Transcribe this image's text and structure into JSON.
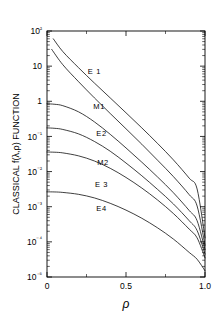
{
  "chart_data": {
    "type": "line",
    "title": "",
    "xlabel": "ρ",
    "ylabel": "CLASSICAL f(λ,ρ) FUNCTION",
    "xlim": [
      0,
      1.0
    ],
    "ylim": [
      1e-05,
      100
    ],
    "yscale": "log",
    "grid": false,
    "legend": "inline-curve-labels",
    "xticks": [
      0,
      0.5,
      1.0
    ],
    "xticklabels": [
      "0",
      "0.5",
      "1.0"
    ],
    "xminorticks": [
      0.25,
      0.75
    ],
    "yticks": [
      100,
      10,
      1,
      0.1,
      0.01,
      0.001,
      0.0001,
      1e-05
    ],
    "yticklabels": [
      "10²",
      "10",
      "1",
      "10⁻¹",
      "10⁻²",
      "10⁻³",
      "10⁻⁴",
      "10⁻⁵"
    ],
    "series": [
      {
        "name": "E1",
        "label": "E 1",
        "x": [
          0.04,
          0.1,
          0.2,
          0.3,
          0.4,
          0.5,
          0.6,
          0.7,
          0.8,
          0.9,
          0.95,
          1.0
        ],
        "y": [
          60.0,
          26.0,
          9.0,
          3.3,
          1.25,
          0.47,
          0.175,
          0.063,
          0.0215,
          0.0065,
          0.0032,
          0.00013
        ]
      },
      {
        "name": "M1",
        "label": "M1",
        "x": [
          0.03,
          0.1,
          0.2,
          0.3,
          0.4,
          0.5,
          0.6,
          0.7,
          0.8,
          0.9,
          0.95,
          1.0
        ],
        "y": [
          30.0,
          11.0,
          3.6,
          1.25,
          0.45,
          0.165,
          0.06,
          0.021,
          0.0072,
          0.0022,
          0.00105,
          8e-05
        ]
      },
      {
        "name": "E2",
        "label": "E2",
        "x": [
          0.0,
          0.05,
          0.1,
          0.2,
          0.3,
          0.4,
          0.5,
          0.6,
          0.7,
          0.8,
          0.9,
          0.95,
          1.0
        ],
        "y": [
          0.85,
          0.82,
          0.75,
          0.5,
          0.26,
          0.115,
          0.047,
          0.0185,
          0.007,
          0.0025,
          0.00078,
          0.0004,
          6e-05
        ]
      },
      {
        "name": "M2",
        "label": "M2",
        "x": [
          0.0,
          0.05,
          0.1,
          0.2,
          0.3,
          0.4,
          0.5,
          0.6,
          0.7,
          0.8,
          0.9,
          0.95,
          1.0
        ],
        "y": [
          0.175,
          0.17,
          0.158,
          0.118,
          0.072,
          0.038,
          0.0175,
          0.0076,
          0.0031,
          0.0012,
          0.0004,
          0.00021,
          4.5e-05
        ]
      },
      {
        "name": "E3",
        "label": "E 3",
        "x": [
          0.0,
          0.05,
          0.1,
          0.2,
          0.3,
          0.4,
          0.5,
          0.6,
          0.7,
          0.8,
          0.9,
          0.95,
          1.0
        ],
        "y": [
          0.036,
          0.0355,
          0.034,
          0.028,
          0.02,
          0.0124,
          0.0068,
          0.0034,
          0.00155,
          0.00064,
          0.00023,
          0.00013,
          3.5e-05
        ]
      },
      {
        "name": "E4",
        "label": "E4",
        "x": [
          0.0,
          0.05,
          0.1,
          0.2,
          0.3,
          0.4,
          0.5,
          0.6,
          0.7,
          0.8,
          0.9,
          0.95,
          1.0
        ],
        "y": [
          0.00265,
          0.00263,
          0.00255,
          0.00225,
          0.00178,
          0.00125,
          0.0008,
          0.00047,
          0.00025,
          0.00012,
          5e-05,
          3.2e-05,
          1.5e-05
        ]
      }
    ],
    "annotations": [
      {
        "text": "E 1",
        "x": 0.3,
        "y": 6.0
      },
      {
        "text": "M1",
        "x": 0.33,
        "y": 0.62
      },
      {
        "text": "E2",
        "x": 0.345,
        "y": 0.105
      },
      {
        "text": "M2",
        "x": 0.355,
        "y": 0.0155
      },
      {
        "text": "E 3",
        "x": 0.345,
        "y": 0.0036
      },
      {
        "text": "E4",
        "x": 0.345,
        "y": 0.00075
      }
    ]
  }
}
